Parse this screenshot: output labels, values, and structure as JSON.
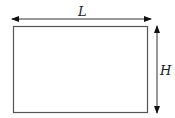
{
  "diagram": {
    "labels": {
      "length": "L",
      "height": "H"
    },
    "colors": {
      "stroke": "#555555",
      "arrow": "#111111",
      "background": "#ffffff"
    }
  }
}
